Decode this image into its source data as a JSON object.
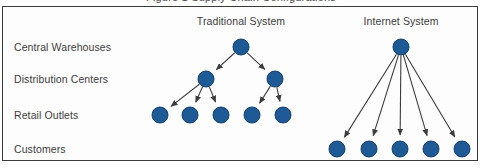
{
  "figure": {
    "caption": "Figure 1  Supply Chain Configurations",
    "frame_border_color": "#3a3a3a",
    "background_color": "#fdfdfd"
  },
  "style": {
    "node_fill": "#1d5a96",
    "node_stroke": "#14406c",
    "node_radius": 8,
    "edge_color": "#3d3d3d",
    "text_color": "#3c3c3c"
  },
  "row_labels": [
    {
      "id": "central-warehouses",
      "text": "Central Warehouses",
      "y": 47
    },
    {
      "id": "distribution-centers",
      "text": "Distribution Centers",
      "y": 79
    },
    {
      "id": "retail-outlets",
      "text": "Retail Outlets",
      "y": 115
    },
    {
      "id": "customers",
      "text": "Customers",
      "y": 149
    }
  ],
  "panels": [
    {
      "id": "traditional-system",
      "heading": "Traditional System",
      "x": 241,
      "y": 22
    },
    {
      "id": "internet-system",
      "heading": "Internet System",
      "x": 401,
      "y": 22
    }
  ],
  "chart_data": {
    "type": "diagram",
    "title": "Figure 1  Supply Chain Configurations",
    "subgraphs": [
      {
        "name": "Traditional System",
        "nodes": [
          {
            "id": "t-cw-1",
            "tier": "Central Warehouses",
            "x": 241,
            "y": 47
          },
          {
            "id": "t-dc-1",
            "tier": "Distribution Centers",
            "x": 206,
            "y": 79
          },
          {
            "id": "t-dc-2",
            "tier": "Distribution Centers",
            "x": 275,
            "y": 79
          },
          {
            "id": "t-ro-1",
            "tier": "Retail Outlets",
            "x": 160,
            "y": 115
          },
          {
            "id": "t-ro-2",
            "tier": "Retail Outlets",
            "x": 190,
            "y": 115
          },
          {
            "id": "t-ro-3",
            "tier": "Retail Outlets",
            "x": 221,
            "y": 115
          },
          {
            "id": "t-ro-4",
            "tier": "Retail Outlets",
            "x": 252,
            "y": 115
          },
          {
            "id": "t-ro-5",
            "tier": "Retail Outlets",
            "x": 283,
            "y": 115
          }
        ],
        "edges": [
          {
            "from": "t-cw-1",
            "to": "t-dc-1"
          },
          {
            "from": "t-cw-1",
            "to": "t-dc-2"
          },
          {
            "from": "t-dc-1",
            "to": "t-ro-1"
          },
          {
            "from": "t-dc-1",
            "to": "t-ro-2"
          },
          {
            "from": "t-dc-1",
            "to": "t-ro-3"
          },
          {
            "from": "t-dc-2",
            "to": "t-ro-4"
          },
          {
            "from": "t-dc-2",
            "to": "t-ro-5"
          }
        ]
      },
      {
        "name": "Internet System",
        "nodes": [
          {
            "id": "i-cw-1",
            "tier": "Central Warehouses",
            "x": 401,
            "y": 47
          },
          {
            "id": "i-cu-1",
            "tier": "Customers",
            "x": 337,
            "y": 149
          },
          {
            "id": "i-cu-2",
            "tier": "Customers",
            "x": 369,
            "y": 149
          },
          {
            "id": "i-cu-3",
            "tier": "Customers",
            "x": 400,
            "y": 149
          },
          {
            "id": "i-cu-4",
            "tier": "Customers",
            "x": 431,
            "y": 149
          },
          {
            "id": "i-cu-5",
            "tier": "Customers",
            "x": 462,
            "y": 149
          }
        ],
        "edges": [
          {
            "from": "i-cw-1",
            "to": "i-cu-1"
          },
          {
            "from": "i-cw-1",
            "to": "i-cu-2"
          },
          {
            "from": "i-cw-1",
            "to": "i-cu-3"
          },
          {
            "from": "i-cw-1",
            "to": "i-cu-4"
          },
          {
            "from": "i-cw-1",
            "to": "i-cu-5"
          }
        ]
      }
    ]
  }
}
